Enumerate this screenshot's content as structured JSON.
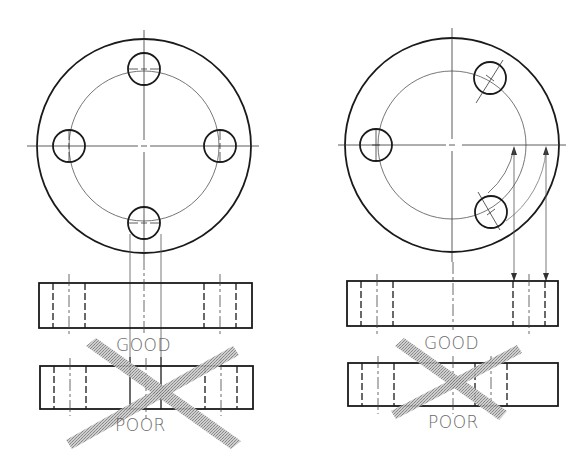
{
  "figures": [
    {
      "id": "left",
      "description": "Four equally spaced holes on bolt circle",
      "good_label": "GOOD",
      "poor_label": "POOR"
    },
    {
      "id": "right",
      "description": "Three holes, two rotated into projection",
      "good_label": "GOOD",
      "poor_label": "POOR"
    }
  ],
  "colors": {
    "line": "#1a1a1a",
    "thin": "#555555",
    "cross": "#9a9a9a",
    "label": "#6a6a6a"
  }
}
